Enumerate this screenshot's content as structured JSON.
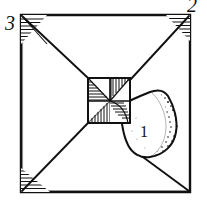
{
  "figure": {
    "type": "line-drawing",
    "background_color": "#ffffff",
    "ink_color": "#111111",
    "width": 207,
    "height": 210
  },
  "frame": {
    "name": "outer-square-frame",
    "left": 19,
    "top": 13,
    "right": 192,
    "bottom": 194,
    "stroke_width": 2.2
  },
  "labels": [
    {
      "id": "label-3",
      "text": "3",
      "x": 8,
      "y": 28,
      "font_size": 19,
      "position": "top-left-outside",
      "describes": "upper-left corner vertex"
    },
    {
      "id": "label-2",
      "text": "2",
      "x": 190,
      "y": 11,
      "font_size": 19,
      "position": "top-right-outside",
      "describes": "upper-right corner vertex"
    },
    {
      "id": "label-1",
      "text": "1",
      "x": 144,
      "y": 136,
      "font_size": 16,
      "position": "inside-stippled-blob",
      "describes": "stippled lobe region"
    }
  ],
  "central_block": {
    "name": "central-hatched-square",
    "left": 88,
    "top": 78,
    "right": 130,
    "bottom": 123,
    "divider_x": 110,
    "divider_y": 101,
    "quadrants": [
      {
        "id": "quadrant-top-left",
        "hatch": "horizontal-stepped",
        "shape": "triangle"
      },
      {
        "id": "quadrant-top-right",
        "hatch": "vertical-stepped",
        "shape": "triangle"
      },
      {
        "id": "quadrant-bottom-left",
        "hatch": "vertical-stepped",
        "shape": "triangle"
      },
      {
        "id": "quadrant-bottom-right",
        "hatch": "curved-diagonal",
        "shape": "lune"
      }
    ]
  },
  "corner_hatches": [
    {
      "id": "corner-hatch-top-left",
      "corner": "top-left",
      "present": true
    },
    {
      "id": "corner-hatch-top-right",
      "corner": "top-right",
      "present": true
    },
    {
      "id": "corner-hatch-bottom-left",
      "corner": "bottom-left",
      "present": true
    },
    {
      "id": "corner-hatch-bottom-right",
      "corner": "bottom-right",
      "present": false
    }
  ],
  "diagonals": [
    {
      "id": "diagonal-top-left",
      "from": [
        21,
        15
      ],
      "to": [
        88,
        78
      ]
    },
    {
      "id": "diagonal-top-right",
      "from": [
        190,
        15
      ],
      "to": [
        130,
        78
      ]
    },
    {
      "id": "diagonal-bottom-left",
      "from": [
        21,
        192
      ],
      "to": [
        88,
        123
      ]
    },
    {
      "id": "diagonal-bottom-right",
      "from": [
        190,
        192
      ],
      "to": [
        140,
        156
      ]
    }
  ],
  "blob": {
    "name": "stippled-lobe",
    "description": "Irregular curved lobe extending right and down from central block, stippled along its right flank",
    "stipple_side": "right",
    "bounds": {
      "left": 122,
      "top": 88,
      "right": 182,
      "bottom": 160
    }
  }
}
